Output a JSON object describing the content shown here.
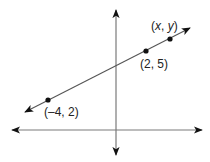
{
  "diagram": {
    "type": "coordinate-plane-line",
    "colors": {
      "axis": "#7a7a7a",
      "line": "#555555",
      "point": "#111111",
      "text": "#222222",
      "background": "#ffffff"
    },
    "axes": {
      "x_axis": {
        "y": 130,
        "x_start": 12,
        "x_end": 202,
        "arrows": "both"
      },
      "y_axis": {
        "x": 116,
        "y_start": 10,
        "y_end": 155,
        "arrows": "both"
      }
    },
    "line": {
      "from": [
        25,
        112
      ],
      "to": [
        190,
        28
      ],
      "arrows": "both"
    },
    "points": [
      {
        "label_open": "(",
        "label_a": "–4",
        "sep": ", ",
        "label_b": "2",
        "label_close": ")",
        "px": [
          48,
          100
        ],
        "label_pos": [
          44,
          106
        ],
        "italic": false
      },
      {
        "label_open": "(",
        "label_a": "2",
        "sep": ", ",
        "label_b": "5",
        "label_close": ")",
        "px": [
          146,
          51
        ],
        "label_pos": [
          140,
          58
        ],
        "italic": false
      },
      {
        "label_open": "(",
        "label_a": "x",
        "sep": ", ",
        "label_b": "y",
        "label_close": ")",
        "px": [
          170,
          39
        ],
        "label_pos": [
          151,
          20
        ],
        "italic": true
      }
    ]
  }
}
